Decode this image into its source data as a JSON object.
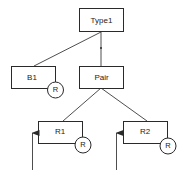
{
  "diagram": {
    "type": "tree",
    "nodes": {
      "type1": {
        "label": "Type1"
      },
      "b1": {
        "label": "B1",
        "badge": "R"
      },
      "pair": {
        "label": "Pair"
      },
      "r1": {
        "label": "R1",
        "badge": "R"
      },
      "r2": {
        "label": "R2",
        "badge": "R"
      }
    },
    "edges": [
      {
        "from": "Type1",
        "to": "B1"
      },
      {
        "from": "Type1",
        "to": "Pair"
      },
      {
        "from": "Pair",
        "to": "R1"
      },
      {
        "from": "Pair",
        "to": "R2"
      }
    ],
    "arrows": [
      {
        "target": "R1",
        "direction": "up"
      },
      {
        "target": "R2",
        "direction": "up"
      }
    ],
    "colors": {
      "stroke": "#2a2a2a",
      "text": "#222222",
      "background": "#ffffff"
    }
  }
}
